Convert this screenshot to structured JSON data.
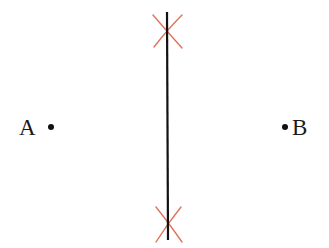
{
  "diagram": {
    "points": [
      {
        "id": "A",
        "label": "A",
        "x": 51,
        "y": 127,
        "label_x": 19,
        "label_y": 135
      },
      {
        "id": "B",
        "label": "B",
        "x": 285,
        "y": 127,
        "label_x": 292,
        "label_y": 135
      }
    ],
    "bisector_line": {
      "x1": 167,
      "y1": 12,
      "x2": 168,
      "y2": 240,
      "color": "#111111"
    },
    "arc_marks": [
      {
        "position": "top",
        "cx": 167,
        "cy": 31,
        "color": "#e0735a"
      },
      {
        "position": "bottom",
        "cx": 168,
        "cy": 225,
        "color": "#e0735a"
      }
    ],
    "colors": {
      "line": "#111111",
      "arc": "#e0735a",
      "point": "#111111",
      "background": "#ffffff"
    }
  }
}
